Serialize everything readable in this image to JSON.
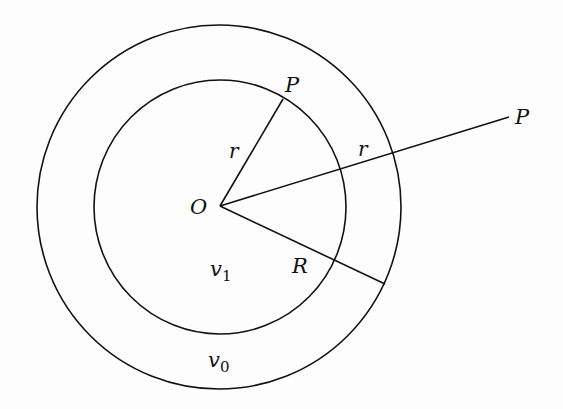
{
  "diagram": {
    "type": "concentric-circles-geometry",
    "stroke_color": "#111111",
    "background": "#fdfdfd",
    "center": {
      "label": "O",
      "x": 220,
      "y": 206
    },
    "circles": [
      {
        "id": "outer",
        "cx": 219,
        "cy": 207,
        "rx": 182,
        "ry": 182,
        "region_label": "v0"
      },
      {
        "id": "inner",
        "cx": 220,
        "cy": 207,
        "rx": 126,
        "ry": 127,
        "region_label": "v1"
      }
    ],
    "segments": [
      {
        "id": "OP-inner",
        "x1": 220,
        "y1": 206,
        "x2": 283,
        "y2": 99,
        "label": "r",
        "endpoint_label": "P"
      },
      {
        "id": "OP-outer",
        "x1": 220,
        "y1": 206,
        "x2": 509,
        "y2": 117,
        "label": "r",
        "endpoint_label": "P"
      },
      {
        "id": "OR",
        "x1": 220,
        "y1": 206,
        "x2": 385,
        "y2": 284,
        "label": "R"
      }
    ],
    "labels": {
      "O": "O",
      "P_inner": "P",
      "P_outer": "P",
      "r_inner": "r",
      "r_outer": "r",
      "R": "R",
      "v1_base": "v",
      "v1_sub": "1",
      "v0_base": "v",
      "v0_sub": "0"
    }
  }
}
